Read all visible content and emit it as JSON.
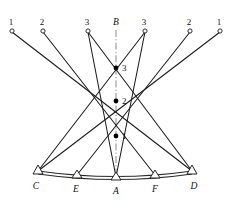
{
  "figure": {
    "kind": "surveying-triangulation-diagram",
    "width": 238,
    "height": 201,
    "background_color": "#ffffff",
    "line_color": "#1a1a1a",
    "centerline_color": "#8a8a8a"
  },
  "top_targets": [
    {
      "id": "t-left-1",
      "label": "1",
      "cx": 12,
      "cy": 31,
      "label_x": 11,
      "label_y": 25
    },
    {
      "id": "t-left-2",
      "label": "2",
      "cx": 43,
      "cy": 31,
      "label_x": 42,
      "label_y": 25
    },
    {
      "id": "t-left-3",
      "label": "3",
      "cx": 88,
      "cy": 31,
      "label_x": 87,
      "label_y": 25
    },
    {
      "id": "t-right-3",
      "label": "3",
      "cx": 145,
      "cy": 31,
      "label_x": 144,
      "label_y": 25
    },
    {
      "id": "t-right-2",
      "label": "2",
      "cx": 190,
      "cy": 31,
      "label_x": 189,
      "label_y": 25
    },
    {
      "id": "t-right-1",
      "label": "1",
      "cx": 220,
      "cy": 31,
      "label_x": 219,
      "label_y": 25
    }
  ],
  "center_nodes": [
    {
      "id": "node-3",
      "label": "3",
      "cx": 116,
      "cy": 68,
      "label_x": 122,
      "label_y": 71
    },
    {
      "id": "node-2",
      "label": "2",
      "cx": 116,
      "cy": 101,
      "label_x": 122,
      "label_y": 104
    },
    {
      "id": "node-1",
      "label": "1",
      "cx": 116,
      "cy": 136,
      "label_x": 122,
      "label_y": 139
    }
  ],
  "stations": [
    {
      "id": "station-C",
      "label": "C",
      "x": 38,
      "y": 172,
      "label_x": 33,
      "label_y": 189
    },
    {
      "id": "station-E",
      "label": "E",
      "x": 77,
      "y": 176,
      "label_x": 72,
      "label_y": 192
    },
    {
      "id": "station-A",
      "label": "A",
      "x": 116,
      "y": 178,
      "label_x": 111,
      "label_y": 194
    },
    {
      "id": "station-F",
      "label": "F",
      "x": 155,
      "y": 176,
      "label_x": 150,
      "label_y": 192
    },
    {
      "id": "station-D",
      "label": "D",
      "x": 192,
      "y": 172,
      "label_x": 189,
      "label_y": 189
    }
  ],
  "centerline": {
    "id": "axis-B-A",
    "label": "B",
    "label_x": 113,
    "label_y": 25,
    "x": 116,
    "y_top": 30,
    "y_bottom": 178
  },
  "rays": [
    {
      "id": "ray-left1-to-D",
      "x1": 12,
      "y1": 32,
      "x2": 192,
      "y2": 171
    },
    {
      "id": "ray-left2-to-F",
      "x1": 43,
      "y1": 32,
      "x2": 155,
      "y2": 175
    },
    {
      "id": "ray-left3-to-A",
      "x1": 88,
      "y1": 32,
      "x2": 116,
      "y2": 177
    },
    {
      "id": "ray-right1-to-C",
      "x1": 220,
      "y1": 32,
      "x2": 38,
      "y2": 171
    },
    {
      "id": "ray-right2-to-E",
      "x1": 190,
      "y1": 32,
      "x2": 77,
      "y2": 175
    },
    {
      "id": "ray-right3-to-A",
      "x1": 145,
      "y1": 32,
      "x2": 116,
      "y2": 177
    },
    {
      "id": "ray-C-to-node3",
      "x1": 38,
      "y1": 171,
      "x2": 145,
      "y2": 32
    },
    {
      "id": "ray-D-to-node3",
      "x1": 192,
      "y1": 171,
      "x2": 88,
      "y2": 32
    }
  ],
  "baseline": {
    "id": "baseline-C-D",
    "outer_path": "M 38 171 Q 116 182 192 171",
    "inner_path": "M 38 174 Q 116 185 192 174"
  }
}
